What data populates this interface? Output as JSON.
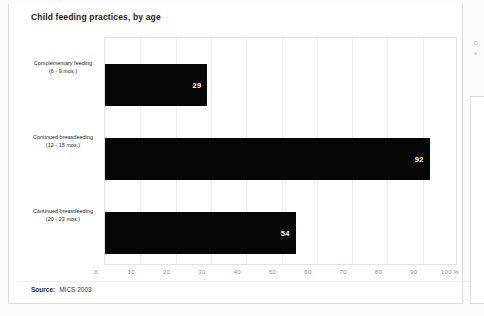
{
  "chart_title": "Child feeding practices, by age",
  "source": {
    "label": "Source:",
    "value": "MICS 2003"
  },
  "ghost_column": {
    "line1": "D",
    "line2": "a"
  },
  "axis": {
    "ticks": [
      "0",
      "10",
      "20",
      "30",
      "40",
      "50",
      "60",
      "70",
      "80",
      "90",
      "100 %"
    ],
    "min": 0,
    "max": 100
  },
  "categories": [
    {
      "line1": "Complementary feeding",
      "line2": "(6 - 9 mos.)",
      "value": "29"
    },
    {
      "line1": "Continued breastfeeding",
      "line2": "(12 - 15 mos.)",
      "value": "92"
    },
    {
      "line1": "Continued breastfeeding",
      "line2": "(20 - 23 mos.)",
      "value": "54"
    }
  ],
  "colors": {
    "bar": "#070707",
    "grid": "#ededed",
    "frame": "#e2e2e2",
    "card_border": "#dcdcdc"
  },
  "chart_data": {
    "type": "bar",
    "orientation": "horizontal",
    "title": "Child feeding practices, by age",
    "categories": [
      "Complementary feeding (6 - 9 mos.)",
      "Continued breastfeeding (12 - 15 mos.)",
      "Continued breastfeeding (20 - 23 mos.)"
    ],
    "values": [
      29,
      92,
      54
    ],
    "xlabel": "",
    "ylabel": "",
    "xlim": [
      0,
      100
    ],
    "xticks": [
      0,
      10,
      20,
      30,
      40,
      50,
      60,
      70,
      80,
      90,
      100
    ],
    "xtick_labels": [
      "0",
      "10",
      "20",
      "30",
      "40",
      "50",
      "60",
      "70",
      "80",
      "90",
      "100 %"
    ],
    "data_labels": [
      "29",
      "92",
      "54"
    ],
    "grid": "vertical",
    "legend": "none",
    "source": "Source: MICS 2003"
  }
}
